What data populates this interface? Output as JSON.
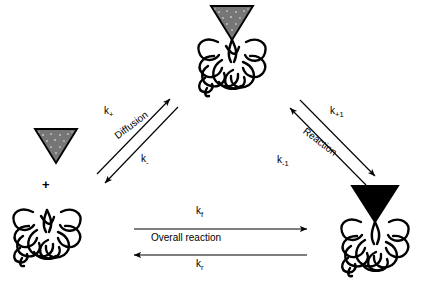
{
  "diagram": {
    "type": "reaction-scheme",
    "background": "#ffffff",
    "ink_color": "#000000",
    "substrate_free_color": "#7a7a7a",
    "substrate_bound_color": "#6e6e6e",
    "product_color": "#000000"
  },
  "species": [
    {
      "id": "free-substrate",
      "name": "free substrate",
      "glyph": "gray-stippled-triangle",
      "position": "left",
      "color": "#808080",
      "has_protein": false
    },
    {
      "id": "free-protein",
      "name": "free protein",
      "glyph": "tangled-loop-coil",
      "position": "bottom-left",
      "color": "#000000",
      "has_protein": true
    },
    {
      "id": "encounter-complex",
      "name": "encounter complex",
      "glyph": "gray-triangle-on-protein",
      "position": "top",
      "color": "#6e6e6e",
      "has_protein": true
    },
    {
      "id": "product-complex",
      "name": "product complex",
      "glyph": "black-triangle-on-protein",
      "position": "bottom-right",
      "color": "#000000",
      "has_protein": true
    }
  ],
  "operators": {
    "plus_sign": "+"
  },
  "arrows": [
    {
      "id": "diffusion-forward",
      "label": "k",
      "subscript": "+",
      "path_name": "Diffusion",
      "direction": "up-right",
      "from": "free-protein",
      "to": "encounter-complex"
    },
    {
      "id": "diffusion-reverse",
      "label": "k",
      "subscript": "-",
      "path_name": "Diffusion",
      "direction": "down-left",
      "from": "encounter-complex",
      "to": "free-protein"
    },
    {
      "id": "reaction-forward",
      "label": "k",
      "subscript": "+1",
      "path_name": "Reaction",
      "direction": "down-right",
      "from": "encounter-complex",
      "to": "product-complex"
    },
    {
      "id": "reaction-reverse",
      "label": "k",
      "subscript": "-1",
      "path_name": "Reaction",
      "direction": "up-left",
      "from": "product-complex",
      "to": "encounter-complex"
    },
    {
      "id": "overall-forward",
      "label": "k",
      "subscript": "f",
      "path_name": "Overall reaction",
      "direction": "right",
      "from": "free-protein",
      "to": "product-complex"
    },
    {
      "id": "overall-reverse",
      "label": "k",
      "subscript": "r",
      "path_name": "Overall reaction",
      "direction": "left",
      "from": "product-complex",
      "to": "free-protein"
    }
  ],
  "labels": {
    "k_plus": "k",
    "k_plus_sub": "+",
    "k_minus": "k",
    "k_minus_sub": "-",
    "k_plus1": "k",
    "k_plus1_sub": "+1",
    "k_minus1": "k",
    "k_minus1_sub": "-1",
    "k_f": "k",
    "k_f_sub": "f",
    "k_r": "k",
    "k_r_sub": "r",
    "diffusion": "Diffusion",
    "reaction": "Reaction",
    "overall_reaction": "Overall reaction",
    "plus": "+"
  }
}
